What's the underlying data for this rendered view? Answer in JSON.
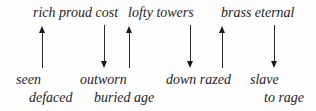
{
  "top_row": {
    "phrase_1": "rich proud cost",
    "phrase_2": "lofty towers",
    "phrase_3": "brass eternal"
  },
  "bottom_row_1": {
    "word_1": "seen",
    "word_2": "outworn",
    "word_3": "down razed",
    "word_4": "slave"
  },
  "bottom_row_2": {
    "word_1": "defaced",
    "word_2": "buried age",
    "word_3": "to rage"
  },
  "arrows": [
    {
      "from": "seen",
      "to": "rich proud cost",
      "direction": "up"
    },
    {
      "from": "rich proud cost",
      "to": "outworn",
      "direction": "down"
    },
    {
      "from": "buried age",
      "to": "lofty towers",
      "direction": "up"
    },
    {
      "from": "lofty towers",
      "to": "down razed",
      "direction": "down"
    },
    {
      "from": "razed",
      "to": "brass eternal",
      "direction": "up"
    },
    {
      "from": "brass eternal",
      "to": "slave",
      "direction": "down"
    }
  ]
}
